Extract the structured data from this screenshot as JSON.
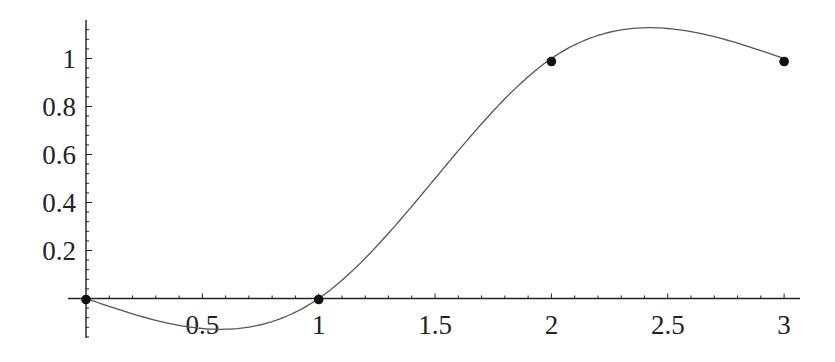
{
  "chart_data": {
    "type": "line",
    "title": "",
    "xlabel": "",
    "ylabel": "",
    "xlim": [
      0,
      3.07
    ],
    "ylim": [
      -0.17,
      1.16
    ],
    "grid": false,
    "legend": null,
    "x_ticks": [
      {
        "value": 0.5,
        "label": "0.5"
      },
      {
        "value": 1,
        "label": "1"
      },
      {
        "value": 1.5,
        "label": "1.5"
      },
      {
        "value": 2,
        "label": "2"
      },
      {
        "value": 2.5,
        "label": "2.5"
      },
      {
        "value": 3,
        "label": "3"
      }
    ],
    "y_ticks": [
      {
        "value": 0.2,
        "label": "0.2"
      },
      {
        "value": 0.4,
        "label": "0.4"
      },
      {
        "value": 0.6,
        "label": "0.6"
      },
      {
        "value": 0.8,
        "label": "0.8"
      },
      {
        "value": 1,
        "label": "1"
      }
    ],
    "series": [
      {
        "name": "data points",
        "style": "points",
        "x": [
          0,
          1,
          2,
          3
        ],
        "y": [
          0,
          0,
          1,
          1
        ]
      },
      {
        "name": "natural cubic spline interpolation",
        "style": "line",
        "interpolates": "data points",
        "minimum": {
          "x": 0.58,
          "y": -0.13
        },
        "maximum": {
          "x": 2.42,
          "y": 1.13
        }
      }
    ],
    "colors": {
      "axis": "#222222",
      "curve": "#555555",
      "points": "#111111"
    }
  }
}
